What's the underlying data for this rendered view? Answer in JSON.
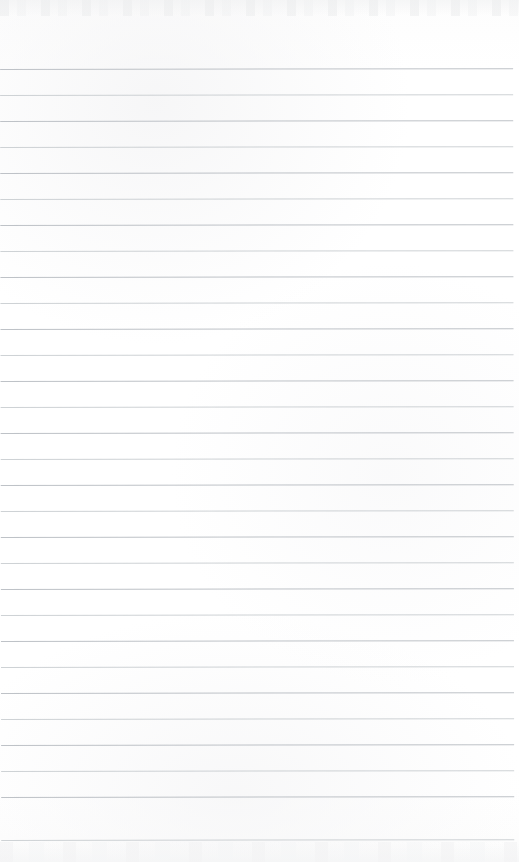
{
  "document": {
    "kind": "scanned-ruled-notebook-page",
    "title": "Blank ruled notebook page",
    "page_width": 519,
    "page_height": 862,
    "background_color": "#fefefe",
    "has_text_content": false,
    "text_content": "",
    "ruling": {
      "line_color": "#b9bdc2",
      "line_color_faint": "#c6cace",
      "line_thickness": 1,
      "line_spacing": 26,
      "first_line_y": 69,
      "line_count": 30,
      "left_margin": 0,
      "right_margin": 6,
      "line_width": 513,
      "skew_degrees": -0.085,
      "line_positions": [
        69,
        95,
        121,
        147,
        173,
        199,
        225,
        251,
        277,
        303,
        329,
        355,
        381,
        407,
        433,
        459,
        485,
        511,
        537,
        563,
        589,
        615,
        641,
        667,
        693,
        719,
        745,
        771,
        797,
        840
      ]
    },
    "artifacts": {
      "top_noise_band_label": "scanner edge noise",
      "top_noise_band_height": 16,
      "bottom_noise_band_label": "scanner edge noise",
      "bottom_noise_band_height": 20
    }
  }
}
